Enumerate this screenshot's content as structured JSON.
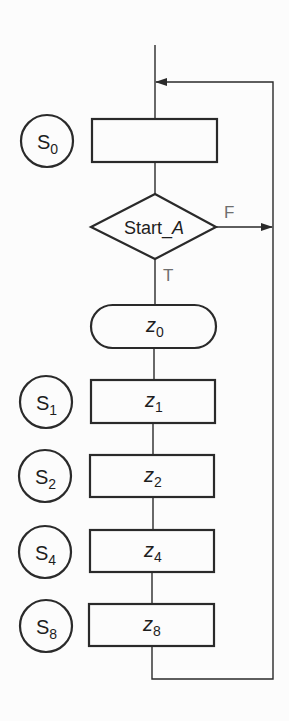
{
  "diagram": {
    "type": "flowchart",
    "colors": {
      "background": "#fcfcfc",
      "stroke": "#2a2a2a",
      "branch_label": "#6e6e6e"
    },
    "initial_state": {
      "state_label": "S",
      "state_sub": "0",
      "output": ""
    },
    "decision": {
      "label_plain": "Start_",
      "label_italic": "A",
      "false_label": "F",
      "true_label": "T"
    },
    "conditional_output": {
      "var": "z",
      "sub": "0"
    },
    "states": [
      {
        "state_label": "S",
        "state_sub": "1",
        "var": "z",
        "sub": "1"
      },
      {
        "state_label": "S",
        "state_sub": "2",
        "var": "z",
        "sub": "2"
      },
      {
        "state_label": "S",
        "state_sub": "4",
        "var": "z",
        "sub": "4"
      },
      {
        "state_label": "S",
        "state_sub": "8",
        "var": "z",
        "sub": "8"
      }
    ]
  }
}
